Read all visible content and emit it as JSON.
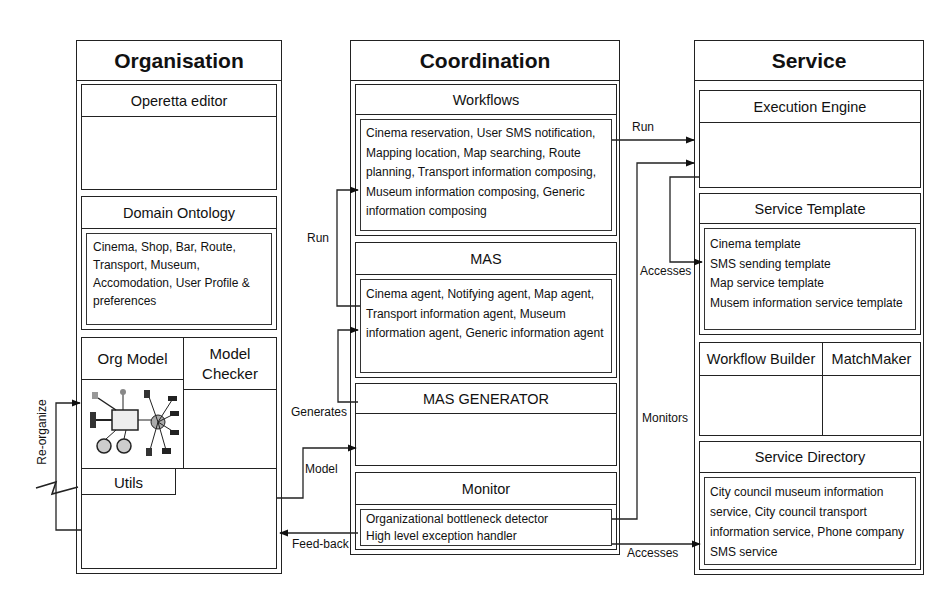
{
  "columns": {
    "organisation": {
      "title": "Organisation",
      "operetta_editor": {
        "label": "Operetta editor"
      },
      "domain_ontology": {
        "label": "Domain Ontology",
        "content": "Cinema, Shop, Bar, Route, Transport, Museum, Accomodation, User Profile & preferences"
      },
      "org_model": {
        "label": "Org Model"
      },
      "model_checker": {
        "label": "Model Checker"
      },
      "utils": {
        "label": "Utils"
      }
    },
    "coordination": {
      "title": "Coordination",
      "workflows": {
        "label": "Workflows",
        "content": "Cinema reservation, User SMS notification, Mapping location, Map searching, Route planning, Transport information composing, Museum information composing, Generic information composing"
      },
      "mas": {
        "label": "MAS",
        "content": "Cinema agent, Notifying agent, Map agent, Transport information agent, Museum information agent, Generic information agent"
      },
      "mas_generator": {
        "label": "MAS GENERATOR"
      },
      "monitor": {
        "label": "Monitor",
        "items": [
          "Organizational bottleneck detector",
          "High level exception handler"
        ]
      }
    },
    "service": {
      "title": "Service",
      "execution_engine": {
        "label": "Execution Engine"
      },
      "service_template": {
        "label": "Service Template",
        "items": [
          "Cinema template",
          "SMS sending template",
          "Map service template",
          "Musem information service template"
        ]
      },
      "workflow_builder": {
        "label": "Workflow Builder"
      },
      "matchmaker": {
        "label": "MatchMaker"
      },
      "service_directory": {
        "label": "Service Directory",
        "content": "City council museum information service, City council transport information service, Phone company SMS service"
      }
    }
  },
  "connectors": {
    "run_workflow": "Run",
    "run_mas": "Run",
    "generates": "Generates",
    "model": "Model",
    "feedback": "Feed-back",
    "reorganize": "Re-organize",
    "accesses_template": "Accesses",
    "monitors": "Monitors",
    "accesses_directory": "Accesses"
  }
}
